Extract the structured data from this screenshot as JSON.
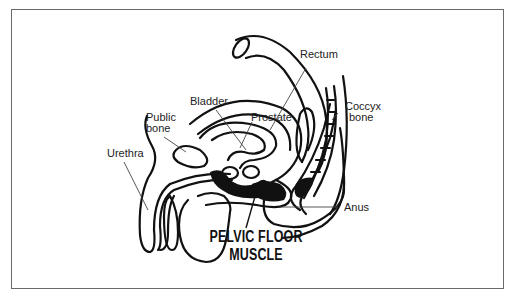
{
  "diagram": {
    "title_line1": "PELVIC FLOOR",
    "title_line2": "MUSCLE",
    "labels": {
      "rectum": "Rectum",
      "bladder": "Bladder",
      "public_bone_line1": "Public",
      "public_bone_line2": "bone",
      "prostate": "Prostate",
      "coccyx_line1": "Coccyx",
      "coccyx_line2": "bone",
      "urethra": "Urethra",
      "anus": "Anus"
    },
    "colors": {
      "outline": "#111111",
      "muscle_fill": "#111111",
      "leader_line": "#444444",
      "frame_border": "#6a6a6a",
      "background": "#ffffff"
    }
  }
}
